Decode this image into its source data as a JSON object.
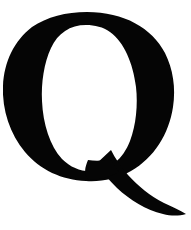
{
  "image": {
    "subject": "Q",
    "description": "Uppercase letter Q",
    "script": "Latin",
    "case": "uppercase",
    "style": "serif high-contrast (Didone-like) letterform",
    "rendering": "solid silhouette, scanned glyph",
    "background_color": "#ffffff",
    "ink_color": "#050505",
    "canvas": {
      "width": 191,
      "height": 230
    },
    "glyph_metrics": {
      "bowl_left_x": 1,
      "bowl_right_x": 173,
      "bowl_top_y": 12,
      "bowl_bottom_y": 180,
      "tail_end_x": 186,
      "tail_end_y": 214,
      "thick_stroke_px": 29,
      "thin_stroke_px": 10,
      "counter_shape": "vertical ellipse"
    }
  }
}
